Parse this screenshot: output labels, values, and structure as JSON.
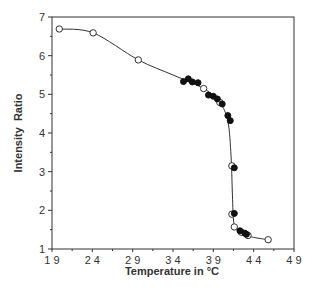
{
  "chart_data": {
    "type": "scatter",
    "title": "",
    "xlabel": "Temperature in °C",
    "ylabel": "Intensity  Ratio",
    "xlim": [
      19,
      49
    ],
    "ylim": [
      1,
      7
    ],
    "x_ticks": [
      19,
      24,
      29,
      34,
      39,
      44,
      49
    ],
    "x_tick_labels": [
      "1 9",
      "2 4",
      "2 9",
      "3 4",
      "3 9",
      "4 4",
      "4 9"
    ],
    "y_ticks": [
      1,
      2,
      3,
      4,
      5,
      6,
      7
    ],
    "y_tick_labels": [
      "1",
      "2",
      "3",
      "4",
      "5",
      "6",
      "7"
    ],
    "grid": false,
    "legend": null,
    "frame": "box",
    "series": [
      {
        "name": "open circles",
        "marker": "open-circle",
        "connected_by_smooth_line": true,
        "points": [
          {
            "x": 19.9,
            "y": 6.69
          },
          {
            "x": 24.1,
            "y": 6.59
          },
          {
            "x": 29.7,
            "y": 5.89
          },
          {
            "x": 37.8,
            "y": 5.15
          },
          {
            "x": 39.8,
            "y": 4.79
          },
          {
            "x": 41.3,
            "y": 3.15
          },
          {
            "x": 41.3,
            "y": 1.9
          },
          {
            "x": 41.6,
            "y": 1.57
          },
          {
            "x": 42.5,
            "y": 1.43
          },
          {
            "x": 43.3,
            "y": 1.35
          },
          {
            "x": 45.8,
            "y": 1.24
          }
        ]
      },
      {
        "name": "filled circles",
        "marker": "filled-circle",
        "connected_by_smooth_line": false,
        "points": [
          {
            "x": 35.3,
            "y": 5.33
          },
          {
            "x": 35.9,
            "y": 5.4
          },
          {
            "x": 36.4,
            "y": 5.32
          },
          {
            "x": 37.1,
            "y": 5.3
          },
          {
            "x": 38.4,
            "y": 4.98
          },
          {
            "x": 39.0,
            "y": 4.95
          },
          {
            "x": 39.5,
            "y": 4.88
          },
          {
            "x": 40.1,
            "y": 4.75
          },
          {
            "x": 40.8,
            "y": 4.45
          },
          {
            "x": 41.1,
            "y": 4.32
          },
          {
            "x": 41.6,
            "y": 3.1
          },
          {
            "x": 41.6,
            "y": 1.92
          },
          {
            "x": 42.3,
            "y": 1.47
          },
          {
            "x": 42.9,
            "y": 1.41
          },
          {
            "x": 43.1,
            "y": 1.38
          }
        ]
      }
    ],
    "curve": [
      {
        "x": 19.9,
        "y": 6.69
      },
      {
        "x": 24.1,
        "y": 6.59
      },
      {
        "x": 29.7,
        "y": 5.89
      },
      {
        "x": 34.0,
        "y": 5.5
      },
      {
        "x": 37.8,
        "y": 5.15
      },
      {
        "x": 39.8,
        "y": 4.79
      },
      {
        "x": 40.8,
        "y": 4.3
      },
      {
        "x": 41.2,
        "y": 3.4
      },
      {
        "x": 41.35,
        "y": 2.5
      },
      {
        "x": 41.5,
        "y": 1.75
      },
      {
        "x": 41.8,
        "y": 1.55
      },
      {
        "x": 42.5,
        "y": 1.43
      },
      {
        "x": 43.3,
        "y": 1.35
      },
      {
        "x": 44.0,
        "y": 1.3
      },
      {
        "x": 45.8,
        "y": 1.24
      }
    ],
    "colors": {
      "axis": "#333333",
      "line": "#333333",
      "marker_fill": "#111111",
      "open_marker_fill": "#ffffff"
    }
  }
}
